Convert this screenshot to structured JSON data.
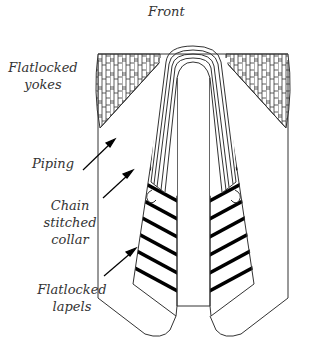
{
  "diagram": {
    "title": "Front",
    "labels": {
      "yokes": [
        "Flatlocked",
        "yokes"
      ],
      "piping": [
        "Piping"
      ],
      "collar": [
        "Chain",
        "stitched",
        "collar"
      ],
      "lapels": [
        "Flatlocked",
        "lapels"
      ]
    },
    "colors": {
      "line": "#333333",
      "stripe": "#000000",
      "text": "#333333",
      "background": "#ffffff"
    }
  }
}
